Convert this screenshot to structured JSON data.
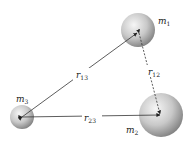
{
  "masses": {
    "m1": {
      "label": "m",
      "sub": "1"
    },
    "m2": {
      "label": "m",
      "sub": "2"
    },
    "m3": {
      "label": "m",
      "sub": "3"
    }
  },
  "distances": {
    "r12": {
      "label": "r",
      "sub": "12"
    },
    "r13": {
      "label": "r",
      "sub": "13"
    },
    "r23": {
      "label": "r",
      "sub": "23"
    }
  },
  "colors": {
    "line": "#333333",
    "sphere_light": "#f4f4f4",
    "sphere_dark": "#8a8a8a"
  }
}
